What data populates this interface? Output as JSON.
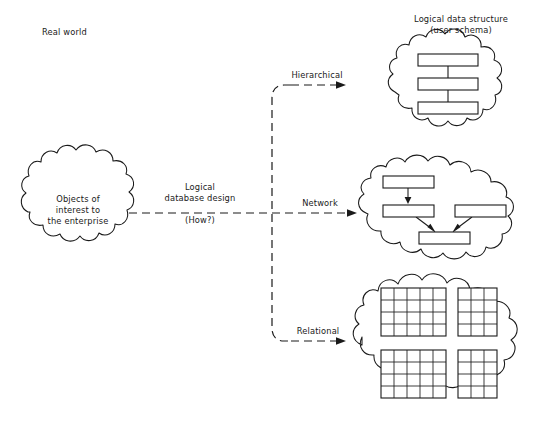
{
  "diagram": {
    "title_left": "Real world",
    "title_right_line1": "Logical data structure",
    "title_right_line2": "(user schema)",
    "source_cloud": {
      "line1": "Objects of",
      "line2": "interest to",
      "line3": "the enterprise"
    },
    "process_label": {
      "line1": "Logical",
      "line2": "database design",
      "line3": "(How?)"
    },
    "branches": [
      {
        "label": "Hierarchical",
        "model": "hierarchical"
      },
      {
        "label": "Network",
        "model": "network"
      },
      {
        "label": "Relational",
        "model": "relational"
      }
    ],
    "hierarchical_model": {
      "boxes": 3,
      "connectors": 2
    },
    "network_model": {
      "boxes": 4,
      "arrows": 3
    },
    "relational_model": {
      "tables": [
        {
          "cols": 5,
          "rows": 4
        },
        {
          "cols": 3,
          "rows": 4
        },
        {
          "cols": 5,
          "rows": 4
        },
        {
          "cols": 3,
          "rows": 4
        }
      ]
    },
    "colors": {
      "stroke": "#1a1a1a",
      "background": "#ffffff"
    }
  }
}
